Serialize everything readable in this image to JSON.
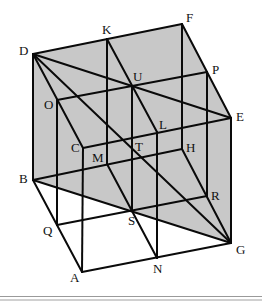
{
  "diagram": {
    "type": "cube-dissection",
    "shade_color": "#c8c8c8",
    "line_color": "#0a0a0a",
    "shaded_polygon": [
      "D",
      "F",
      "E",
      "G",
      "B"
    ],
    "points": {
      "D": [
        33,
        54
      ],
      "K": [
        107,
        39
      ],
      "F": [
        182,
        24
      ],
      "O": [
        57,
        100
      ],
      "U": [
        132,
        86
      ],
      "P": [
        207,
        72
      ],
      "C": [
        83,
        148
      ],
      "L": [
        157,
        132
      ],
      "E": [
        231,
        118
      ],
      "M": [
        107,
        164
      ],
      "T": [
        132,
        148
      ],
      "H": [
        182,
        149
      ],
      "B": [
        33,
        180
      ],
      "S": [
        132,
        210
      ],
      "R": [
        207,
        196
      ],
      "Q": [
        57,
        225
      ],
      "N": [
        157,
        258
      ],
      "G": [
        231,
        243
      ],
      "A": [
        82,
        272
      ]
    },
    "segments": [
      [
        "D",
        "F"
      ],
      [
        "F",
        "E"
      ],
      [
        "E",
        "G"
      ],
      [
        "D",
        "B"
      ],
      [
        "B",
        "A"
      ],
      [
        "A",
        "G"
      ],
      [
        "D",
        "E"
      ],
      [
        "D",
        "G"
      ],
      [
        "D",
        "C"
      ],
      [
        "B",
        "G"
      ],
      [
        "O",
        "P"
      ],
      [
        "Q",
        "R"
      ],
      [
        "C",
        "E"
      ],
      [
        "B",
        "H"
      ],
      [
        "K",
        "L"
      ],
      [
        "M",
        "N"
      ],
      [
        "H",
        "G"
      ],
      [
        "O",
        "Q"
      ],
      [
        "C",
        "A"
      ],
      [
        "K",
        "M"
      ],
      [
        "U",
        "S"
      ],
      [
        "L",
        "N"
      ],
      [
        "F",
        "H"
      ],
      [
        "P",
        "R"
      ]
    ],
    "labels": [
      {
        "text": "D",
        "x": 19,
        "y": 55
      },
      {
        "text": "K",
        "x": 102,
        "y": 34
      },
      {
        "text": "F",
        "x": 186,
        "y": 22
      },
      {
        "text": "O",
        "x": 44,
        "y": 109
      },
      {
        "text": "U",
        "x": 133,
        "y": 81
      },
      {
        "text": "P",
        "x": 212,
        "y": 74
      },
      {
        "text": "C",
        "x": 71,
        "y": 152
      },
      {
        "text": "L",
        "x": 159,
        "y": 129
      },
      {
        "text": "E",
        "x": 236,
        "y": 121
      },
      {
        "text": "M",
        "x": 92,
        "y": 162
      },
      {
        "text": "T",
        "x": 135,
        "y": 151
      },
      {
        "text": "H",
        "x": 186,
        "y": 152
      },
      {
        "text": "B",
        "x": 19,
        "y": 183
      },
      {
        "text": "S",
        "x": 128,
        "y": 225
      },
      {
        "text": "R",
        "x": 211,
        "y": 200
      },
      {
        "text": "Q",
        "x": 43,
        "y": 235
      },
      {
        "text": "N",
        "x": 153,
        "y": 273
      },
      {
        "text": "G",
        "x": 236,
        "y": 254
      },
      {
        "text": "A",
        "x": 70,
        "y": 282
      }
    ]
  }
}
